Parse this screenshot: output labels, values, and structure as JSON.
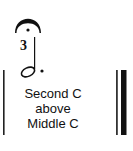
{
  "notation": {
    "note": {
      "type": "dotted-half-note",
      "fingering": "3",
      "articulation": "fermata"
    },
    "barlines": {
      "left": "single",
      "right": "final-double"
    }
  },
  "label": {
    "line1": "Second C",
    "line2": "above",
    "line3": "Middle C"
  },
  "colors": {
    "ink": "#111111",
    "background": "#ffffff"
  }
}
